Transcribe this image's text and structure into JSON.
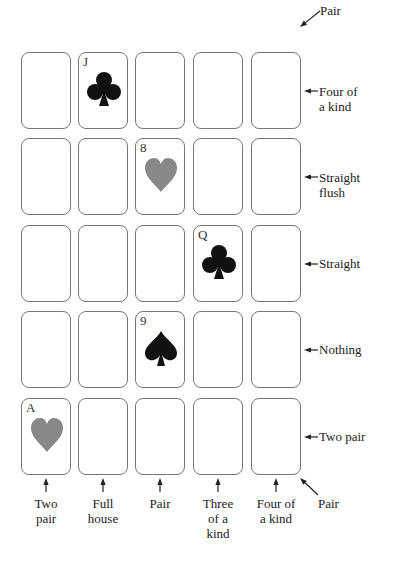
{
  "grid": {
    "rows": 5,
    "cols": 5,
    "cards": [
      {
        "row": 0,
        "col": 1,
        "rank": "J",
        "suit": "clubs",
        "color": "#111111"
      },
      {
        "row": 1,
        "col": 2,
        "rank": "8",
        "suit": "hearts",
        "color": "#888888"
      },
      {
        "row": 2,
        "col": 3,
        "rank": "Q",
        "suit": "clubs",
        "color": "#111111"
      },
      {
        "row": 3,
        "col": 2,
        "rank": "9",
        "suit": "spades",
        "color": "#111111"
      },
      {
        "row": 4,
        "col": 0,
        "rank": "A",
        "suit": "hearts",
        "color": "#888888"
      }
    ]
  },
  "labels": {
    "diag_top": "Pair",
    "rows": [
      "Four of a kind",
      "Straight flush",
      "Straight",
      "Nothing",
      "Two pair"
    ],
    "rows_lines": [
      [
        "Four of",
        "a kind"
      ],
      [
        "Straight",
        "flush"
      ],
      [
        "Straight"
      ],
      [
        "Nothing"
      ],
      [
        "Two pair"
      ]
    ],
    "cols_lines": [
      [
        "Two",
        "pair"
      ],
      [
        "Full",
        "house"
      ],
      [
        "Pair"
      ],
      [
        "Three",
        "of a",
        "kind"
      ],
      [
        "Four of",
        "a kind"
      ]
    ],
    "diag_bottom": "Pair"
  }
}
